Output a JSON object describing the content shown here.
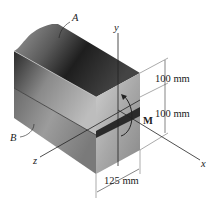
{
  "figure": {
    "labels": {
      "top_section": "A",
      "bottom_section": "B",
      "y_axis": "y",
      "z_axis": "z",
      "x_axis": "x",
      "moment": "M"
    },
    "dimensions": {
      "upper_height": "100 mm",
      "lower_height": "100 mm",
      "width": "125 mm"
    },
    "colors": {
      "dark": "#2a2a2a",
      "mid": "#7a7a7a",
      "light": "#d6d6d6",
      "line": "#333333"
    }
  }
}
